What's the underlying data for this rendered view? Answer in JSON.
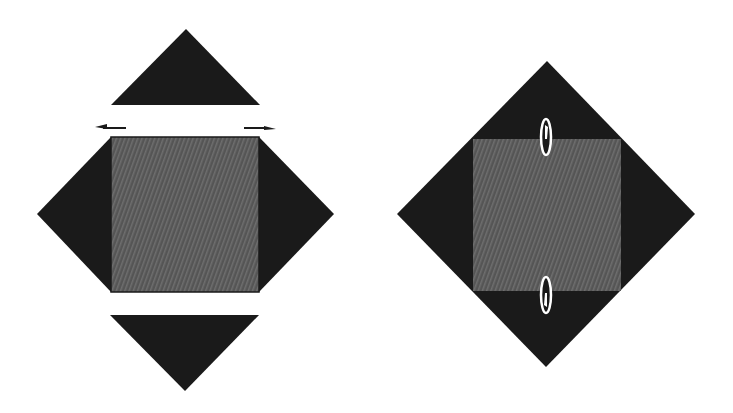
{
  "figure": {
    "colors": {
      "background": "#ffffff",
      "triangle_fill": "#1a1a1a",
      "square_fill": "#555555",
      "square_hatch": "#6e6e6e",
      "marker_fill": "#ffffff",
      "marker_stroke": "#111111"
    },
    "left_panel": {
      "top_triangle": {
        "points": "111,105 260,105 186,29"
      },
      "left_arrow": {
        "x1": 126,
        "x2": 95,
        "y": 128,
        "direction": "left"
      },
      "right_arrow": {
        "x1": 244,
        "x2": 276,
        "y": 128,
        "direction": "right"
      },
      "left_triangle": {
        "points": "111,137 111,292 37,214"
      },
      "right_triangle": {
        "points": "259,137 259,292 334,214"
      },
      "square": {
        "x": 111,
        "y": 137,
        "width": 148,
        "height": 155
      },
      "bottom_triangle": {
        "points": "110,315 259,315 185,391"
      }
    },
    "right_panel": {
      "diamond": {
        "points": "547,61 695,214 546,367 397,214"
      },
      "square": {
        "x": 473,
        "y": 139,
        "width": 148,
        "height": 152
      },
      "top_marker": {
        "cx": 546,
        "cy": 137,
        "rx": 5,
        "ry": 18
      },
      "bottom_marker": {
        "cx": 546,
        "cy": 295,
        "rx": 5,
        "ry": 18
      }
    }
  }
}
